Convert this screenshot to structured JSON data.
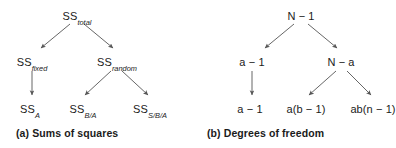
{
  "figure": {
    "panels": [
      {
        "id": "a",
        "caption": "(a) Sums of squares",
        "nodes": {
          "root": {
            "main": "SS",
            "sub": "total"
          },
          "left": {
            "main": "SS",
            "sub": "fixed"
          },
          "right": {
            "main": "SS",
            "sub": "random"
          },
          "leaf1": {
            "main": "SS",
            "sub": "A"
          },
          "leaf2": {
            "main": "SS",
            "sub": "B/A"
          },
          "leaf3": {
            "main": "SS",
            "sub": "S/B/A"
          }
        }
      },
      {
        "id": "b",
        "caption": "(b) Degrees of freedom",
        "nodes": {
          "root": {
            "main": "N − 1"
          },
          "left": {
            "main": "a − 1"
          },
          "right": {
            "main": "N − a"
          },
          "leaf1": {
            "main": "a − 1"
          },
          "leaf2": {
            "main": "a(b − 1)"
          },
          "leaf3": {
            "main": "ab(n − 1)"
          }
        }
      }
    ],
    "colors": {
      "text": "#1b1b1b",
      "arrow": "#555555",
      "background": "#ffffff"
    }
  }
}
